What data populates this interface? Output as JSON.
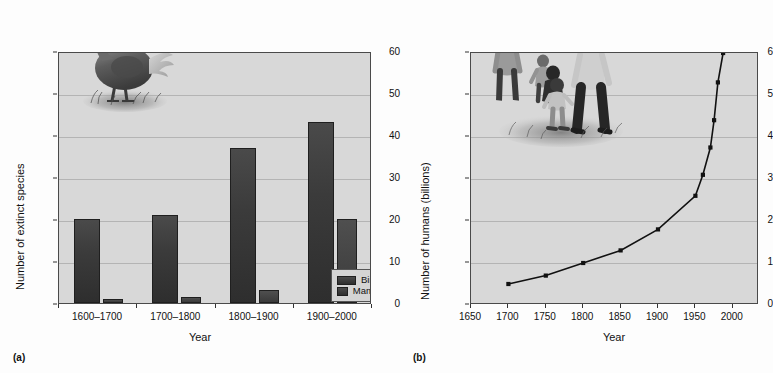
{
  "figure": {
    "panels": [
      {
        "tag": "(a)"
      },
      {
        "tag": "(b)"
      }
    ]
  },
  "panel_a": {
    "tag": "(a)",
    "ylabel": "Number of extinct species",
    "xlabel": "Year",
    "legend": {
      "items": [
        {
          "label": "Birds",
          "color": "#3a3a3a"
        },
        {
          "label": "Mammals",
          "color": "#3a3a3a"
        }
      ]
    },
    "art": "dodo-illustration",
    "yticks": [
      "0",
      "10",
      "20",
      "30",
      "40",
      "50",
      "60"
    ],
    "xticks": [
      "1600–1700",
      "1700–1800",
      "1800–1900",
      "1900–2000"
    ]
  },
  "panel_b": {
    "tag": "(b)",
    "ylabel": "Number of humans (billions)",
    "xlabel": "Year",
    "art": "human-family-illustration",
    "yticks": [
      "0",
      "1",
      "2",
      "3",
      "4",
      "5",
      "6"
    ],
    "xticks": [
      "1650",
      "1700",
      "1750",
      "1800",
      "1850",
      "1900",
      "1950",
      "2000"
    ]
  },
  "chart_data": [
    {
      "type": "bar",
      "title": "",
      "panel": "(a)",
      "categories": [
        "1600–1700",
        "1700–1800",
        "1800–1900",
        "1900–2000"
      ],
      "series": [
        {
          "name": "Birds",
          "values": [
            20,
            21,
            37,
            43
          ],
          "color": "#3a3a3a"
        },
        {
          "name": "Mammals",
          "values": [
            1,
            1.5,
            3,
            20
          ],
          "color": "#3a3a3a"
        }
      ],
      "xlabel": "Year",
      "ylabel": "Number of extinct species",
      "ylim": [
        0,
        60
      ],
      "ytick_step": 10,
      "grid": true,
      "legend_position": "bottom-right"
    },
    {
      "type": "line",
      "title": "",
      "panel": "(b)",
      "x": [
        1700,
        1750,
        1800,
        1850,
        1900,
        1950,
        1960,
        1970,
        1975,
        1980,
        1987
      ],
      "y": [
        0.5,
        0.7,
        1.0,
        1.3,
        1.8,
        2.6,
        3.1,
        3.75,
        4.4,
        5.3,
        6.0
      ],
      "series": [
        {
          "name": "World population",
          "x": [
            1700,
            1750,
            1800,
            1850,
            1900,
            1950,
            1960,
            1970,
            1975,
            1980,
            1987
          ],
          "values": [
            0.5,
            0.7,
            1.0,
            1.3,
            1.8,
            2.6,
            3.1,
            3.75,
            4.4,
            5.3,
            6.0
          ],
          "color": "#111111",
          "marker": "square"
        }
      ],
      "xlabel": "Year",
      "ylabel": "Number of humans (billions)",
      "xlim": [
        1650,
        2035
      ],
      "ylim": [
        0,
        6
      ],
      "xtick_step": 50,
      "ytick_step": 1,
      "grid": true,
      "legend_position": "none"
    }
  ]
}
